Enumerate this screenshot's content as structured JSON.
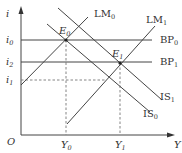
{
  "diagram": {
    "type": "IS-LM-BP diagram",
    "axes": {
      "y_label": "i",
      "x_label": "Y",
      "origin_label": "O"
    },
    "y_ticks": [
      {
        "label": "i",
        "sub": "0",
        "y": 40
      },
      {
        "label": "i",
        "sub": "2",
        "y": 62
      },
      {
        "label": "i",
        "sub": "1",
        "y": 80
      }
    ],
    "x_ticks": [
      {
        "label": "Y",
        "sub": "0",
        "x": 66
      },
      {
        "label": "Y",
        "sub": "1",
        "x": 120
      }
    ],
    "curves": [
      {
        "name": "LM",
        "sub": "0",
        "kind": "upward"
      },
      {
        "name": "LM",
        "sub": "1",
        "kind": "upward"
      },
      {
        "name": "BP",
        "sub": "0",
        "kind": "horizontal"
      },
      {
        "name": "BP",
        "sub": "1",
        "kind": "horizontal"
      },
      {
        "name": "IS",
        "sub": "1",
        "kind": "downward"
      },
      {
        "name": "IS",
        "sub": "0",
        "kind": "downward"
      }
    ],
    "points": [
      {
        "name": "E",
        "sub": "0"
      },
      {
        "name": "E",
        "sub": "1"
      }
    ],
    "colors": {
      "line": "#444444",
      "dashed": "#777777",
      "text": "#333333"
    }
  }
}
